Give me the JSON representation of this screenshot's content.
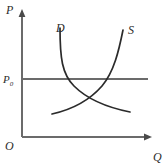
{
  "figure": {
    "name": "supply-demand-diagram",
    "background": "#ffffff",
    "width": 168,
    "height": 165
  },
  "axes": {
    "vertical": {
      "label": "P",
      "label_x": 6,
      "label_y": 14,
      "x": 22,
      "y_top": 12,
      "y_bottom": 137,
      "color": "#6b6b6b",
      "arrow": "up"
    },
    "horizontal": {
      "label": "Q",
      "label_x": 153,
      "label_y": 161,
      "y": 137,
      "x_left": 22,
      "x_right": 150,
      "color": "#6b6b6b",
      "arrow": "right"
    },
    "origin": {
      "label": "O",
      "label_x": 6,
      "label_y": 150
    }
  },
  "price_line": {
    "label": "P",
    "subscript": "0",
    "label_x": 3,
    "label_y": 83,
    "y": 79,
    "x_start": 22,
    "x_end": 148,
    "color": "#6b6b6b"
  },
  "curves": [
    {
      "id": "demand",
      "label": "D",
      "label_x": 56,
      "label_y": 32,
      "color": "#2b2b2b",
      "path": "M 60,28 C 60,58 62,74 74,86 C 88,100 110,108 130,112"
    },
    {
      "id": "supply",
      "label": "S",
      "label_x": 128,
      "label_y": 34,
      "color": "#2b2b2b",
      "path": "M 52,114 C 70,110 88,102 102,86 C 114,72 119,50 123,30"
    }
  ],
  "chart_data": {
    "type": "line",
    "title": "",
    "xlabel": "Q",
    "ylabel": "P",
    "grid": false,
    "legend": "inline-curve-labels",
    "annotations": [
      {
        "text": "O",
        "role": "origin"
      },
      {
        "text": "P0",
        "role": "reference-price-level"
      },
      {
        "text": "D",
        "role": "demand-curve-label"
      },
      {
        "text": "S",
        "role": "supply-curve-label"
      }
    ],
    "series": [
      {
        "name": "D",
        "description": "Demand curve, downward sloping, convex to origin",
        "x": [
          60,
          64,
          70,
          78,
          90,
          104,
          118,
          130
        ],
        "y": [
          28,
          52,
          70,
          88,
          98,
          105,
          109,
          112
        ]
      },
      {
        "name": "S",
        "description": "Supply curve, upward sloping, steep at high quantity",
        "x": [
          52,
          62,
          74,
          86,
          96,
          106,
          114,
          120,
          123
        ],
        "y": [
          114,
          112,
          107,
          100,
          90,
          76,
          58,
          42,
          30
        ]
      },
      {
        "name": "P0",
        "description": "Horizontal reference price line above equilibrium",
        "x": [
          22,
          148
        ],
        "y": [
          79,
          79
        ]
      }
    ],
    "xlim": [
      22,
      150
    ],
    "ylim": [
      137,
      12
    ]
  }
}
